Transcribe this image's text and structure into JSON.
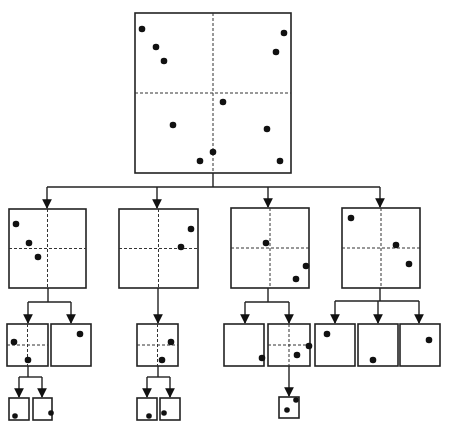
{
  "diagram": {
    "title": "",
    "type": "quadtree-decomposition",
    "colors": {
      "stroke": "#222222",
      "point": "#111111",
      "background": "#ffffff"
    },
    "nodes": [
      {
        "id": "root",
        "x": 135,
        "y": 13,
        "w": 156,
        "h": 160,
        "split": true,
        "points": [
          [
            142,
            29
          ],
          [
            156,
            47
          ],
          [
            164,
            61
          ],
          [
            284,
            33
          ],
          [
            276,
            52
          ],
          [
            223,
            102
          ],
          [
            173,
            125
          ],
          [
            267,
            129
          ],
          [
            213,
            152
          ],
          [
            200,
            161
          ],
          [
            280,
            161
          ]
        ]
      },
      {
        "id": "q1",
        "x": 9,
        "y": 209,
        "w": 77,
        "h": 79,
        "split": true,
        "points": [
          [
            16,
            224
          ],
          [
            29,
            243
          ],
          [
            38,
            257
          ]
        ]
      },
      {
        "id": "q2",
        "x": 119,
        "y": 209,
        "w": 79,
        "h": 79,
        "split": true,
        "points": [
          [
            191,
            229
          ],
          [
            181,
            247
          ]
        ]
      },
      {
        "id": "q3",
        "x": 231,
        "y": 208,
        "w": 78,
        "h": 80,
        "split": true,
        "points": [
          [
            266,
            243
          ],
          [
            306,
            266
          ],
          [
            296,
            279
          ]
        ]
      },
      {
        "id": "q4",
        "x": 342,
        "y": 208,
        "w": 78,
        "h": 80,
        "split": true,
        "points": [
          [
            351,
            218
          ],
          [
            396,
            245
          ],
          [
            409,
            264
          ]
        ]
      },
      {
        "id": "q1a",
        "x": 7,
        "y": 324,
        "w": 41,
        "h": 42,
        "split": true,
        "points": [
          [
            14,
            342
          ],
          [
            28,
            360
          ]
        ]
      },
      {
        "id": "q1b",
        "x": 51,
        "y": 324,
        "w": 40,
        "h": 42,
        "split": false,
        "points": [
          [
            80,
            334
          ]
        ]
      },
      {
        "id": "q2a",
        "x": 137,
        "y": 324,
        "w": 41,
        "h": 42,
        "split": true,
        "points": [
          [
            171,
            342
          ],
          [
            162,
            360
          ]
        ]
      },
      {
        "id": "q3a",
        "x": 224,
        "y": 324,
        "w": 40,
        "h": 42,
        "split": false,
        "points": [
          [
            262,
            358
          ]
        ]
      },
      {
        "id": "q3b",
        "x": 268,
        "y": 324,
        "w": 42,
        "h": 42,
        "split": true,
        "points": [
          [
            309,
            346
          ],
          [
            297,
            355
          ]
        ]
      },
      {
        "id": "q4a",
        "x": 315,
        "y": 324,
        "w": 40,
        "h": 42,
        "split": false,
        "points": [
          [
            327,
            334
          ]
        ]
      },
      {
        "id": "q4b",
        "x": 358,
        "y": 324,
        "w": 40,
        "h": 42,
        "split": false,
        "points": [
          [
            373,
            360
          ]
        ]
      },
      {
        "id": "q4c",
        "x": 400,
        "y": 324,
        "w": 40,
        "h": 42,
        "split": false,
        "points": [
          [
            429,
            340
          ]
        ]
      },
      {
        "id": "q1a1",
        "x": 9,
        "y": 398,
        "w": 20,
        "h": 22,
        "split": false,
        "points": [
          [
            15,
            416
          ]
        ]
      },
      {
        "id": "q1a2",
        "x": 33,
        "y": 398,
        "w": 19,
        "h": 22,
        "split": false,
        "points": [
          [
            51,
            413
          ]
        ]
      },
      {
        "id": "q2a1",
        "x": 137,
        "y": 398,
        "w": 20,
        "h": 22,
        "split": false,
        "points": [
          [
            149,
            416
          ]
        ]
      },
      {
        "id": "q2a2",
        "x": 160,
        "y": 398,
        "w": 20,
        "h": 22,
        "split": false,
        "points": [
          [
            164,
            413
          ]
        ]
      },
      {
        "id": "q3b1",
        "x": 279,
        "y": 397,
        "w": 20,
        "h": 21,
        "split": false,
        "points": [
          [
            287,
            410
          ],
          [
            296,
            400
          ]
        ]
      }
    ],
    "edges": [
      {
        "from": [
          213,
          173
        ],
        "bus_y": 187,
        "to": [
          {
            "x": 47,
            "y": 209
          },
          {
            "x": 157,
            "y": 209
          },
          {
            "x": 268,
            "y": 208
          },
          {
            "x": 380,
            "y": 208
          }
        ]
      },
      {
        "from": [
          48,
          288
        ],
        "bus_y": 302,
        "to": [
          {
            "x": 28,
            "y": 324
          },
          {
            "x": 71,
            "y": 324
          }
        ]
      },
      {
        "from": [
          158,
          288
        ],
        "bus_y": 302,
        "to": [
          {
            "x": 158,
            "y": 324
          }
        ]
      },
      {
        "from": [
          268,
          288
        ],
        "bus_y": 302,
        "to": [
          {
            "x": 245,
            "y": 324
          },
          {
            "x": 289,
            "y": 324
          }
        ]
      },
      {
        "from": [
          380,
          288
        ],
        "bus_y": 301,
        "to": [
          {
            "x": 335,
            "y": 324
          },
          {
            "x": 378,
            "y": 324
          },
          {
            "x": 419,
            "y": 324
          }
        ]
      },
      {
        "from": [
          28,
          366
        ],
        "bus_y": 377,
        "to": [
          {
            "x": 19,
            "y": 398
          },
          {
            "x": 42,
            "y": 398
          }
        ]
      },
      {
        "from": [
          158,
          366
        ],
        "bus_y": 377,
        "to": [
          {
            "x": 147,
            "y": 398
          },
          {
            "x": 170,
            "y": 398
          }
        ]
      },
      {
        "from": [
          289,
          366
        ],
        "bus_y": 366,
        "to": [
          {
            "x": 289,
            "y": 397
          }
        ]
      }
    ]
  }
}
